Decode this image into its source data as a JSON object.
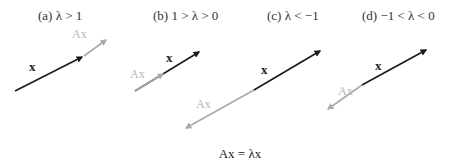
{
  "colors": {
    "x_vector": "#1a1a1a",
    "ax_vector": "#aaaaaa",
    "ax_label": "#b5b5b5",
    "text": "#333333",
    "background": "#ffffff"
  },
  "panels": [
    {
      "id": "a",
      "title": "(a)  λ > 1",
      "x_label": "x",
      "ax_label": "Ax",
      "case": "lambda greater than 1: Ax is longer than x, same direction",
      "x_vector": {
        "from": [
          15,
          91
        ],
        "to": [
          84,
          56
        ]
      },
      "ax_vector": {
        "from": [
          84,
          56
        ],
        "to": [
          109,
          38
        ]
      }
    },
    {
      "id": "b",
      "title": "(b)  1 > λ > 0",
      "x_label": "x",
      "ax_label": "Ax",
      "case": "lambda between 0 and 1: Ax is shorter than x, same direction",
      "x_vector": {
        "from": [
          135,
          91
        ],
        "to": [
          201,
          51
        ]
      },
      "ax_vector": {
        "from": [
          135,
          91
        ],
        "to": [
          165,
          73
        ]
      }
    },
    {
      "id": "c",
      "title": "(c)  λ < −1",
      "x_label": "x",
      "ax_label": "Ax",
      "case": "lambda less than -1: Ax is longer and points opposite to x",
      "x_vector": {
        "from": [
          254,
          90
        ],
        "to": [
          322,
          50
        ]
      },
      "ax_vector": {
        "from": [
          254,
          90
        ],
        "to": [
          184,
          129
        ]
      }
    },
    {
      "id": "d",
      "title": "(d)  −1 < λ < 0",
      "x_label": "x",
      "ax_label": "Ax",
      "case": "lambda between -1 and 0: Ax is shorter and points opposite to x",
      "x_vector": {
        "from": [
          362,
          85
        ],
        "to": [
          428,
          49
        ]
      },
      "ax_vector": {
        "from": [
          362,
          85
        ],
        "to": [
          326,
          111
        ]
      }
    }
  ],
  "formula": "Ax = λx"
}
